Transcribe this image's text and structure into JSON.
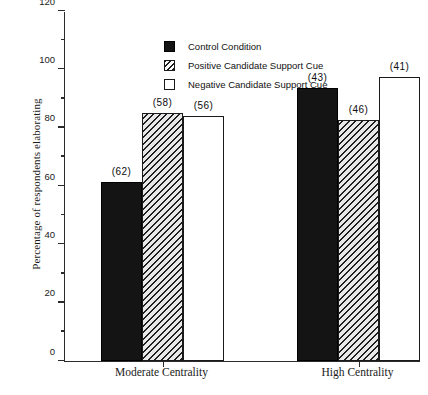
{
  "chart_data": {
    "type": "bar",
    "title": "",
    "xlabel": "",
    "ylabel": "Percentage of respondents elaborating",
    "categories": [
      "Moderate Centrality",
      "High Centrality"
    ],
    "ylim": [
      0,
      120
    ],
    "ytick_labels": [
      "0",
      "20",
      "40",
      "60",
      "80",
      "100",
      "120"
    ],
    "ytick_values": [
      0,
      20,
      40,
      60,
      80,
      100,
      120
    ],
    "yminor_values": [
      10,
      30,
      50,
      70,
      90,
      110
    ],
    "grid": false,
    "legend_position": "upper-left-inside",
    "series": [
      {
        "name": "Control Condition",
        "swatch": "solid-black",
        "values": [
          61.5,
          93.5
        ],
        "labels": [
          "(62)",
          "(43)"
        ]
      },
      {
        "name": "Positive Candidate Support Cue",
        "swatch": "diagonal-hatch",
        "values": [
          85.0,
          82.5
        ],
        "labels": [
          "(58)",
          "(46)"
        ]
      },
      {
        "name": "Negative Candidate Support Cue",
        "swatch": "white-outline",
        "values": [
          84.0,
          97.5
        ],
        "labels": [
          "(56)",
          "(41)"
        ]
      }
    ]
  },
  "colors": {
    "control": "#141414",
    "hatch": "#1f1f1f",
    "negative": "#ffffff",
    "axis": "#2b2b2b",
    "text": "#111111",
    "background": "#ffffff"
  }
}
